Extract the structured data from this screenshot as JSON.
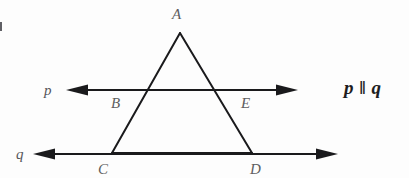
{
  "figure": {
    "type": "geometry-diagram",
    "width": 409,
    "height": 178,
    "background_color": "#fdfdfd",
    "stroke_color": "#1a1a1c",
    "label_color": "#5e5e60",
    "note_color": "#1d1d1f"
  },
  "labels": {
    "apex": "A",
    "left_transversal_point": "B",
    "right_transversal_point": "E",
    "left_base_vertex": "C",
    "right_base_vertex": "D",
    "upper_line": "p",
    "lower_line": "q"
  },
  "notation": {
    "parallel_statement": "p ‖ q"
  },
  "geometry": {
    "points": {
      "A": {
        "x": 180,
        "y": 33
      },
      "B": {
        "x": 147,
        "y": 90
      },
      "E": {
        "x": 218,
        "y": 90
      },
      "C": {
        "x": 112,
        "y": 153
      },
      "D": {
        "x": 252,
        "y": 153
      }
    },
    "lines": {
      "p": {
        "y": 90,
        "x_start": 66,
        "x_end": 298,
        "arrows": "both"
      },
      "q": {
        "y": 154,
        "x_start": 33,
        "x_end": 338,
        "arrows": "both"
      }
    },
    "triangle_sides": [
      {
        "name": "AC",
        "from": "A",
        "to": "C"
      },
      {
        "name": "AD",
        "from": "A",
        "to": "D"
      },
      {
        "name": "CD",
        "from": "C",
        "to": "D"
      }
    ]
  }
}
